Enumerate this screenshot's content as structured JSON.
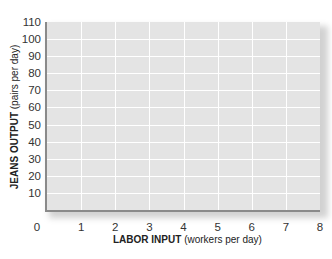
{
  "chart_data": {
    "type": "line",
    "title": "",
    "xlabel": {
      "bold": "LABOR INPUT",
      "rest": "(workers per day)"
    },
    "ylabel": {
      "bold": "JEANS OUTPUT",
      "rest": "(pairs per day)"
    },
    "xlim": [
      0,
      8
    ],
    "ylim": [
      0,
      110
    ],
    "x_ticks": [
      "0",
      "1",
      "2",
      "3",
      "4",
      "5",
      "6",
      "7",
      "8"
    ],
    "y_ticks": [
      "10",
      "20",
      "30",
      "40",
      "50",
      "60",
      "70",
      "80",
      "90",
      "100",
      "110"
    ],
    "grid": true,
    "series": []
  },
  "colors": {
    "plot_background": "#e4e4e4",
    "gridlines": "#ffffff",
    "axis": "#8a8a8a"
  }
}
